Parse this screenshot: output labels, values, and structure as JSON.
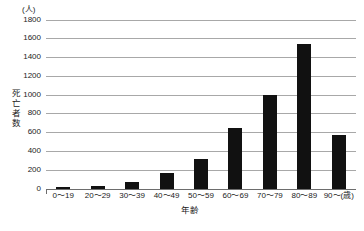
{
  "chart_data": {
    "type": "bar",
    "title": "",
    "subtitle": "",
    "xlabel": "年齢",
    "ylabel": "死亡者数",
    "y_unit": "(人)",
    "x_unit": "(歳)",
    "categories": [
      "0～19",
      "20～29",
      "30～39",
      "40～49",
      "50～59",
      "60～69",
      "70～79",
      "80～89",
      "90～"
    ],
    "values": [
      12,
      22,
      65,
      165,
      310,
      640,
      995,
      1540,
      575
    ],
    "ylim": [
      0,
      1800
    ],
    "yticks": [
      0,
      200,
      400,
      600,
      800,
      1000,
      1200,
      1400,
      1600,
      1800
    ],
    "ytick_labels": [
      "0",
      "200",
      "400",
      "600",
      "800",
      "1000",
      "1200",
      "1400",
      "1600",
      "1800"
    ],
    "grid": true,
    "grid_axis": "y",
    "legend": false,
    "bar_color": "#111111",
    "grid_color": "#a8a8a8",
    "axis_color": "#6d6d6d",
    "background": "#ffffff"
  }
}
